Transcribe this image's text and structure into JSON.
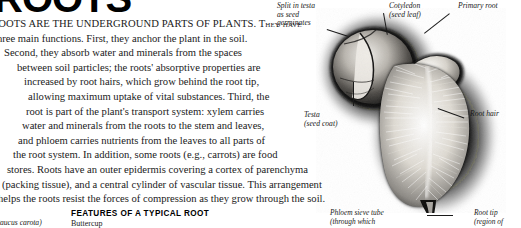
{
  "document": {
    "masthead_title": "ROOTS",
    "body_lines": [
      "ROOTS ARE THE UNDERGROUND PARTS OF PLANTS. They have",
      "three main functions. First, they anchor the plant in the soil.",
      "Second, they absorb water and minerals from the spaces",
      "between soil particles; the roots' absorptive properties are",
      "increased by root hairs, which grow behind the root tip,",
      "allowing maximum uptake of vital substances. Third, the",
      "root is part of the plant's transport system: xylem carries",
      "water and minerals from the roots to the stem and leaves,",
      "and phloem carries nutrients from the leaves to all parts of",
      "the root system. In addition, some roots (e.g., carrots) are food",
      "stores. Roots have an outer epidermis covering a cortex of parenchyma",
      "(packing tissue), and a central cylinder of vascular tissue. This arrangement",
      "helps the roots resist the forces of compression as they grow through the soil."
    ]
  },
  "photo": {
    "caption_title": "GERMINATING BEAN SEED",
    "labels": [
      {
        "id": "split-in-testa",
        "text": "Split in testa\nas seed\ngerminates"
      },
      {
        "id": "cotyledon",
        "text": "Cotyledon\n(seed leaf)"
      },
      {
        "id": "primary-root",
        "text": "Primary root"
      },
      {
        "id": "root-hair",
        "text": "Root hair"
      },
      {
        "id": "testa",
        "text": "Testa\n(seed coat)"
      }
    ]
  },
  "bottom": {
    "left_partial_italic": "(Daucus carota)",
    "caption_title": "FEATURES OF A TYPICAL ROOT",
    "caption_subtitle": "Buttercup",
    "phloem_label": "Phloem sieve tube\n(through which",
    "root_tip_label": "Root tip\n(region of"
  },
  "colors": {
    "ink": "#1a1a1a",
    "paper": "#ffffff",
    "photo_dark": "#0a0a0a",
    "photo_mid": "#6e6e6e",
    "photo_light": "#e8e6e2"
  }
}
